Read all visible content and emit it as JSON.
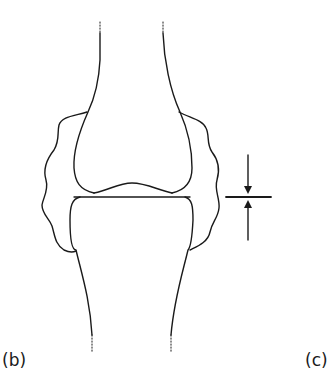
{
  "figure": {
    "panels": [
      {
        "label": "(b)",
        "content": "joint with wavy synovial capsule outline, upper and lower bone ends"
      },
      {
        "label": "(c)",
        "content": ""
      }
    ],
    "annotations": {
      "joint_space_marker": "opposing arrows indicating joint space width"
    },
    "colors": {
      "line": "#1a1a1a",
      "background": "#ffffff"
    }
  }
}
